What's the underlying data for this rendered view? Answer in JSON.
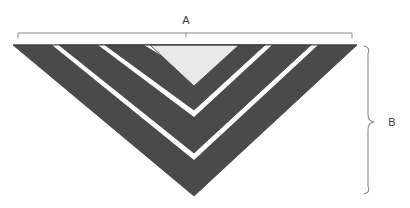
{
  "figure": {
    "background_color": "#ffffff",
    "title": "",
    "shape_name": "nested-inverted-triangles",
    "clipped_header_text": "",
    "colors": {
      "band_fill": "#4a4a4a",
      "band_outline": "#3f3f3f",
      "gap_fill": "#ffffff",
      "inner_fill": "#e9e9e9",
      "inner_outline": "#58585a",
      "annotation_stroke": "#8a8a8a",
      "label_color": "#3c3c3c"
    },
    "geometry": {
      "top_left_x": 13,
      "top_right_x": 357,
      "top_y": 45,
      "apex_x": 194,
      "apex_y": 196,
      "band_count": 3,
      "band_thickness": 26,
      "gap_thickness": 5
    },
    "annotations": {
      "width": {
        "label": "A",
        "label_x": 186,
        "label_y": 20,
        "line_y": 33,
        "x_start": 18,
        "x_end": 352,
        "tick_length": 5,
        "center_tick_x": 186,
        "orientation": "horizontal",
        "style": "line-with-end-ticks"
      },
      "height": {
        "label": "B",
        "label_x": 397,
        "label_y": 125,
        "brace_x": 373,
        "y_start": 46,
        "y_end": 194,
        "orientation": "vertical",
        "style": "curly-brace"
      }
    }
  }
}
